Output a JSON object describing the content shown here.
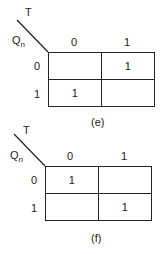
{
  "maps": [
    {
      "id": "e",
      "caption": "(e)",
      "col_var": "T",
      "row_var": "Qn",
      "row_var_main": "Q",
      "row_var_sub": "n",
      "col_headers": [
        "0",
        "1"
      ],
      "row_headers": [
        "0",
        "1"
      ],
      "cells": [
        [
          "",
          "1"
        ],
        [
          "1",
          ""
        ]
      ]
    },
    {
      "id": "f",
      "caption": "(f)",
      "col_var": "T",
      "row_var": "Qn",
      "row_var_main": "Q",
      "row_var_sub": "n",
      "col_headers": [
        "0",
        "1"
      ],
      "row_headers": [
        "0",
        "1"
      ],
      "cells": [
        [
          "1",
          ""
        ],
        [
          "",
          "1"
        ]
      ]
    }
  ]
}
